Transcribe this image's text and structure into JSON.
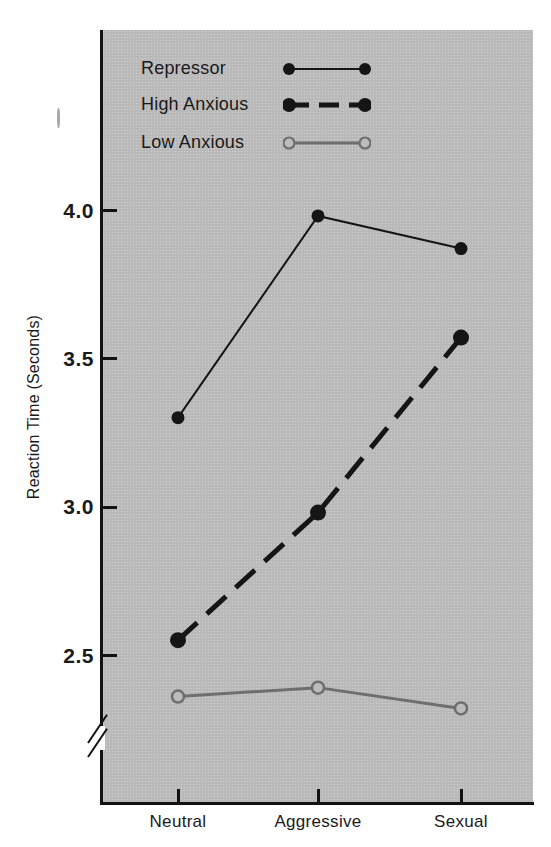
{
  "chart_data": {
    "type": "line",
    "title": "",
    "xlabel": "",
    "ylabel": "Reaction Time (Seconds)",
    "categories": [
      "Neutral",
      "Aggressive",
      "Sexual"
    ],
    "ylim": [
      2.25,
      4.12
    ],
    "yticks": [
      2.5,
      3.0,
      3.5,
      4.0
    ],
    "ytick_labels": [
      "2.5",
      "3.0",
      "3.5",
      "4.0"
    ],
    "y_axis_broken": true,
    "grid": false,
    "legend_position": "top-left-inside",
    "series": [
      {
        "name": "Repressor",
        "values": [
          3.3,
          3.98,
          3.87
        ],
        "line_style": "solid",
        "line_width": 2,
        "color": "#151515",
        "marker": "filled-circle"
      },
      {
        "name": "High Anxious",
        "values": [
          2.55,
          2.98,
          3.57
        ],
        "line_style": "dashed",
        "line_width": 5,
        "color": "#151515",
        "marker": "filled-circle"
      },
      {
        "name": "Low Anxious",
        "values": [
          2.36,
          2.39,
          2.32
        ],
        "line_style": "solid",
        "line_width": 3,
        "color": "#6e6e6e",
        "marker": "open-circle"
      }
    ]
  },
  "axes": {
    "y_title": "Reaction Time (Seconds)",
    "y_tick_labels": [
      "4.0",
      "3.5",
      "3.0",
      "2.5"
    ],
    "x_tick_labels": [
      "Neutral",
      "Aggressive",
      "Sexual"
    ]
  },
  "legend": {
    "items": [
      {
        "label": "Repressor",
        "style": "solid-thin-filled"
      },
      {
        "label": "High Anxious",
        "style": "dashed-thick-filled"
      },
      {
        "label": "Low Anxious",
        "style": "solid-gray-open"
      }
    ]
  },
  "colors": {
    "panel_background": "#b9b9b9",
    "page_background": "#ffffff",
    "ink": "#151515",
    "gray_series": "#6e6e6e"
  }
}
